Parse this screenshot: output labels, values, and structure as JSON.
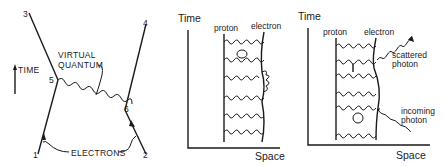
{
  "diagram1": {
    "time_label": "TIME",
    "vertex_labels": [
      "1",
      "2",
      "3",
      "4",
      "5",
      "6"
    ],
    "virtual_quantum_label": [
      "VIRTUAL",
      "QUANTUM"
    ],
    "electrons_label": "ELECTRONS"
  },
  "diagram2": {
    "time_axis_label": "Time",
    "space_axis_label": "Space",
    "proton_label": "proton",
    "electron_label": "electron"
  },
  "diagram3": {
    "time_axis_label": "Time",
    "space_axis_label": "Space",
    "proton_label": "proton",
    "electron_label": "electron",
    "scattered_photon_label": [
      "scattered",
      "photon"
    ],
    "incoming_photon_label": [
      "incoming",
      "photon"
    ]
  }
}
